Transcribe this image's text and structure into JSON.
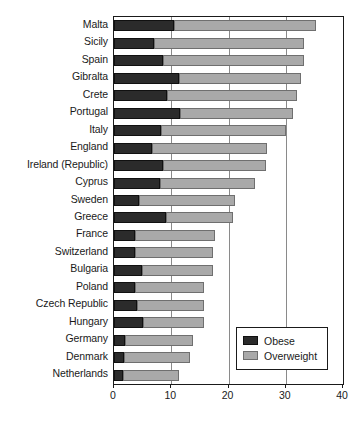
{
  "chart_data": {
    "type": "bar",
    "orientation": "horizontal",
    "stacked": true,
    "title": "",
    "subtitle": "",
    "xlabel": "",
    "ylabel": "",
    "xlim": [
      0,
      40
    ],
    "ylim": null,
    "xticks": [
      0,
      10,
      20,
      30,
      40
    ],
    "xticklabels": [
      "0",
      "10",
      "20",
      "30",
      "40"
    ],
    "grid": "vertical",
    "legend_position": "inside-bottom-right",
    "categories": [
      "Malta",
      "Sicily",
      "Spain",
      "Gibralta",
      "Crete",
      "Portugal",
      "Italy",
      "England",
      "Ireland (Republic)",
      "Cyprus",
      "Sweden",
      "Greece",
      "France",
      "Switzerland",
      "Bulgaria",
      "Poland",
      "Czech Republic",
      "Hungary",
      "Germany",
      "Denmark",
      "Netherlands"
    ],
    "series": [
      {
        "name": "Obese",
        "color": "#2b2b2b",
        "values": [
          10.5,
          7.0,
          8.6,
          11.4,
          9.3,
          11.5,
          8.2,
          6.6,
          8.6,
          8.1,
          4.4,
          9.1,
          3.7,
          3.7,
          4.9,
          3.7,
          4.0,
          5.0,
          1.9,
          1.8,
          1.5
        ]
      },
      {
        "name": "Overweight",
        "color": "#a9a9a9",
        "values": [
          24.8,
          26.2,
          24.6,
          21.3,
          22.7,
          19.8,
          21.9,
          20.2,
          17.9,
          16.6,
          16.8,
          11.7,
          14.0,
          13.6,
          12.4,
          12.0,
          11.7,
          10.8,
          11.9,
          11.5,
          9.9
        ]
      }
    ],
    "totals": [
      35.3,
      33.2,
      33.2,
      32.7,
      32.0,
      31.3,
      30.1,
      26.8,
      26.5,
      24.7,
      21.2,
      20.8,
      17.7,
      17.3,
      17.3,
      15.7,
      15.7,
      15.8,
      13.8,
      13.3,
      11.4
    ]
  },
  "legend": {
    "items": [
      {
        "label": "Obese"
      },
      {
        "label": "Overweight"
      }
    ]
  }
}
